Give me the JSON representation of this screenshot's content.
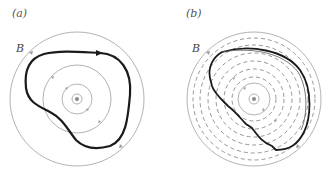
{
  "figure": {
    "panels": [
      {
        "id": "a",
        "label": "(a)",
        "field_label": "B",
        "center": [
          77,
          99
        ],
        "field_circles_radii": [
          4,
          15,
          34,
          67
        ],
        "loop_style": "solid",
        "description": "Closed Amperian loop (bold, with arrow) surrounding central current wire; concentric magnetic field lines with direction arrows"
      },
      {
        "id": "b",
        "label": "(b)",
        "field_label": "B",
        "center": [
          254,
          99
        ],
        "field_circles_radii": [
          5,
          16,
          67
        ],
        "dashed_circles_radii": [
          22,
          30,
          38,
          46,
          54,
          61
        ],
        "loop_style": "stepped",
        "description": "Loop approximated by radial and arc segments along dashed circles"
      }
    ],
    "colors": {
      "field_line": "#b3b3b3",
      "loop": "#1a1a1a",
      "dashed": "#8a8a8a",
      "arrow": "#9a9a9a"
    }
  }
}
